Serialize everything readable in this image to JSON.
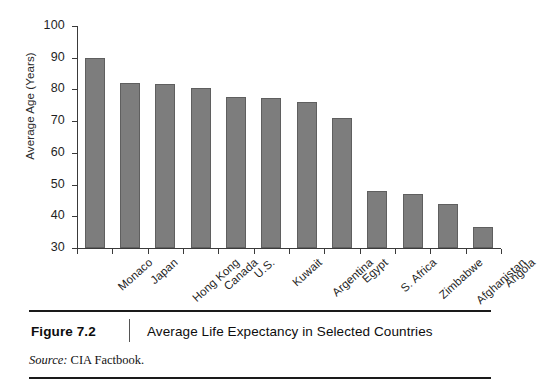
{
  "figure": {
    "number_label": "Figure 7.2",
    "caption": "Average Life Expectancy in Selected Countries",
    "source_label": "Source:",
    "source_text": "CIA Factbook."
  },
  "chart_data": {
    "type": "bar",
    "title": "Average Life Expectancy in Selected Countries",
    "xlabel": "",
    "ylabel": "Average Age (Years)",
    "ylim": [
      30,
      100
    ],
    "yticks": [
      30,
      40,
      50,
      60,
      70,
      80,
      90,
      100
    ],
    "ytick_labels": [
      "30",
      "40",
      "50",
      "60",
      "70",
      "80",
      "90",
      "100"
    ],
    "grid": false,
    "legend": false,
    "bar_color": "#7d7d7d",
    "categories": [
      "Monaco",
      "Japan",
      "Hong Kong",
      "Canada",
      "U.S.",
      "Kuwait",
      "Argentina",
      "Egypt",
      "S. Africa",
      "Zimbabwe",
      "Afghanistan",
      "Angola"
    ],
    "values": [
      90,
      82,
      81.8,
      80.5,
      77.5,
      77.3,
      76,
      71,
      48,
      47,
      44,
      36.5
    ]
  }
}
